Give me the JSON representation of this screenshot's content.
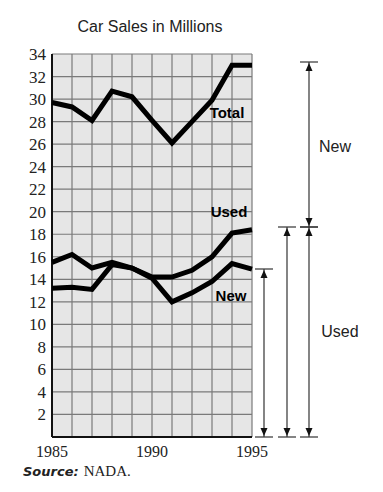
{
  "chart_data": {
    "type": "line",
    "title": "Car Sales in Millions",
    "xlabel": "",
    "ylabel": "",
    "x": [
      1985,
      1986,
      1987,
      1988,
      1989,
      1990,
      1991,
      1992,
      1993,
      1994,
      1995
    ],
    "x_tick_labels": [
      "1985",
      "1990",
      "1995"
    ],
    "y_ticks": [
      2,
      4,
      6,
      8,
      10,
      12,
      14,
      16,
      18,
      20,
      22,
      24,
      26,
      28,
      30,
      32,
      34
    ],
    "ylim": [
      0,
      34
    ],
    "xlim": [
      1985,
      1995
    ],
    "grid": true,
    "series": [
      {
        "name": "Total",
        "values": [
          29.7,
          29.3,
          28.1,
          30.7,
          30.2,
          28.1,
          26.1,
          28.0,
          29.9,
          33.0,
          33.0
        ]
      },
      {
        "name": "Used",
        "values": [
          15.5,
          16.2,
          15.0,
          15.5,
          15.0,
          14.2,
          14.2,
          14.8,
          16.0,
          18.1,
          18.4
        ]
      },
      {
        "name": "New",
        "values": [
          13.2,
          13.3,
          13.1,
          15.3,
          15.0,
          14.1,
          12.0,
          12.8,
          13.8,
          15.4,
          14.9
        ]
      }
    ],
    "annotations": [
      {
        "type": "bracket",
        "label": "New",
        "from": 18.4,
        "to": 33.0
      },
      {
        "type": "bracket",
        "label": "Used",
        "from": 0,
        "to": 18.4
      },
      {
        "type": "bracket",
        "label": "",
        "from": 0,
        "to": 14.9
      }
    ],
    "source": "NADA."
  },
  "labels": {
    "title": "Car Sales in Millions",
    "source_prefix": "Source:",
    "source_value": "NADA.",
    "series_total": "Total",
    "series_used": "Used",
    "series_new": "New",
    "bracket_new": "New",
    "bracket_used": "Used",
    "x_1985": "1985",
    "x_1990": "1990",
    "x_1995": "1995"
  },
  "colors": {
    "plot_bg": "#e6e6e6",
    "grid": "#7a7a7a",
    "line": "#000000"
  }
}
